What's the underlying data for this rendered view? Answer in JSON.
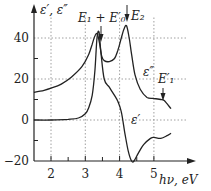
{
  "chart_data": {
    "type": "line",
    "title": "",
    "xlabel": "hν, eV",
    "ylabel": "ε′, ε″",
    "xlim": [
      1.5,
      5.6
    ],
    "ylim": [
      -20,
      50
    ],
    "xticks": [
      2,
      3,
      4,
      5
    ],
    "yticks": [
      -20,
      0,
      20,
      40
    ],
    "grid": true,
    "series": [
      {
        "name": "ε″",
        "x": [
          1.5,
          1.8,
          2.0,
          2.3,
          2.6,
          2.9,
          3.1,
          3.2,
          3.28,
          3.35,
          3.42,
          3.48,
          3.55,
          3.7,
          3.85,
          3.95,
          4.05,
          4.12,
          4.2,
          4.28,
          4.35,
          4.45,
          4.6,
          4.8,
          5.0,
          5.2,
          5.3,
          5.5
        ],
        "values": [
          13.5,
          14.5,
          15.5,
          17.5,
          21,
          26,
          32,
          37,
          41,
          42,
          37,
          31,
          29,
          28.5,
          30,
          34,
          40,
          44,
          46,
          40,
          32,
          22,
          15,
          11,
          10.5,
          10,
          9.5,
          5.5
        ]
      },
      {
        "name": "ε′",
        "x": [
          1.5,
          2.0,
          2.5,
          2.8,
          3.0,
          3.1,
          3.2,
          3.28,
          3.34,
          3.4,
          3.45,
          3.55,
          3.7,
          3.85,
          3.95,
          4.05,
          4.15,
          4.25,
          4.35,
          4.42,
          4.55,
          4.7,
          4.9,
          5.0,
          5.2,
          5.4,
          5.5
        ],
        "values": [
          0,
          0,
          0.3,
          1,
          3,
          6,
          12,
          24,
          40,
          43,
          34,
          20,
          16,
          12,
          9,
          4,
          -6,
          -15,
          -20,
          -20,
          -16,
          -12,
          -9,
          -8.5,
          -9,
          -7.5,
          -6.5
        ]
      }
    ],
    "annotations": [
      {
        "text": "E₁ + E′₀",
        "x": 3.4,
        "arrow": true
      },
      {
        "text": "E₂",
        "x": 4.2,
        "arrow": true
      },
      {
        "text": "E′₁",
        "x": 5.3,
        "arrow": true
      },
      {
        "text": "ε″",
        "x": 4.9,
        "y": 15
      },
      {
        "text": "ε′",
        "x": 4.35,
        "y": -3
      }
    ]
  },
  "labels": {
    "ylabel": "ε′, ε″",
    "xlabel": "hν, eV",
    "e1e0": "E₁ + E′₀",
    "e2": "E₂",
    "e1p": "E′₁",
    "epp": "ε″",
    "ep": "ε′"
  }
}
